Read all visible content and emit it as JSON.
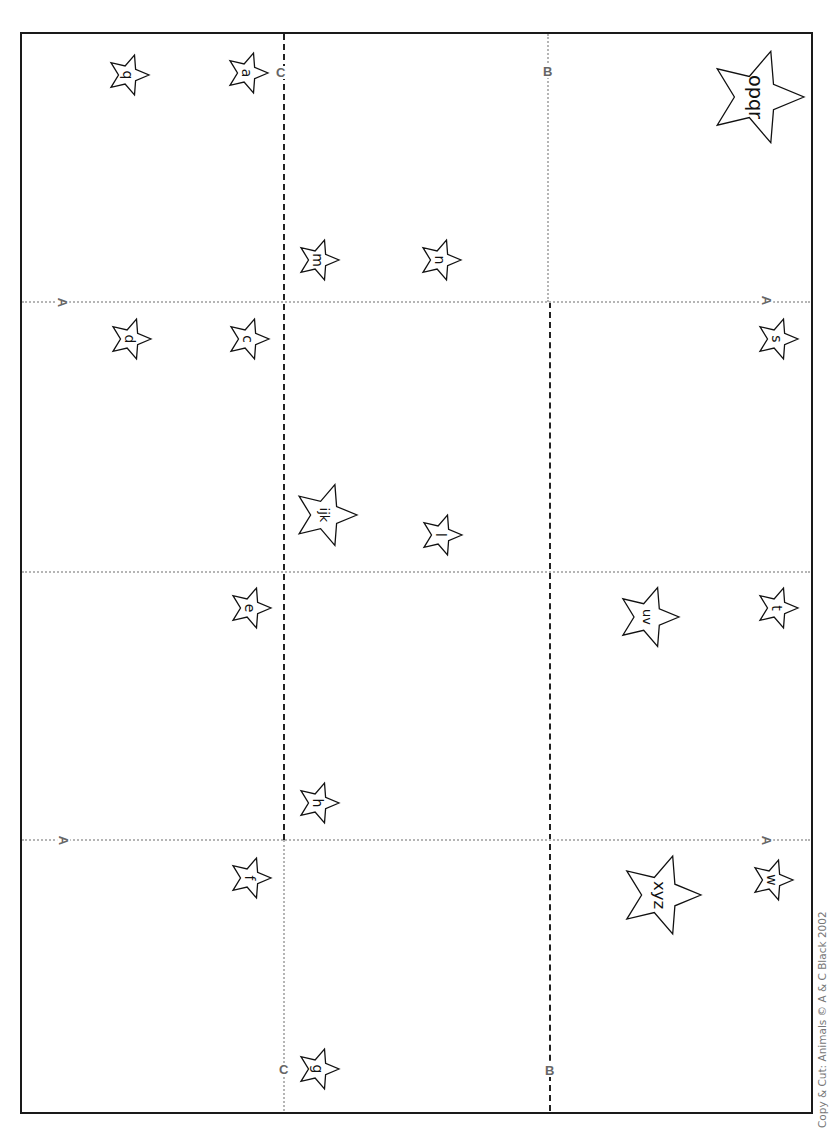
{
  "worksheet": {
    "copyright": "Copy & Cut: Animals © A & C Black 2002",
    "colors": {
      "border": "#1a1a1a",
      "cut_line": "#222222",
      "fold_line": "#b5b5b5",
      "guide_label": "#666666"
    },
    "guide_labels": [
      {
        "id": "c-top",
        "text": "C",
        "x": 276,
        "y": 66
      },
      {
        "id": "b-top",
        "text": "B",
        "x": 543,
        "y": 65
      },
      {
        "id": "a-left-1",
        "text": "A",
        "x": 58,
        "y": 296
      },
      {
        "id": "a-right-1",
        "text": "A",
        "x": 762,
        "y": 294
      },
      {
        "id": "a-left-2",
        "text": "A",
        "x": 59,
        "y": 834
      },
      {
        "id": "a-right-2",
        "text": "A",
        "x": 762,
        "y": 834
      },
      {
        "id": "c-bottom",
        "text": "C",
        "x": 279,
        "y": 1063
      },
      {
        "id": "b-bottom",
        "text": "B",
        "x": 545,
        "y": 1064
      }
    ],
    "stars": [
      {
        "id": "star-q",
        "text": "q",
        "cx": 128,
        "cy": 75,
        "size": 42
      },
      {
        "id": "star-a",
        "text": "a",
        "cx": 247,
        "cy": 73,
        "size": 42
      },
      {
        "id": "star-m",
        "text": "m",
        "cx": 318,
        "cy": 260,
        "size": 42
      },
      {
        "id": "star-n",
        "text": "n",
        "cx": 440,
        "cy": 260,
        "size": 42
      },
      {
        "id": "star-opqr",
        "text": "opqr",
        "cx": 756,
        "cy": 97,
        "size": 96
      },
      {
        "id": "star-d",
        "text": "d",
        "cx": 130,
        "cy": 339,
        "size": 42
      },
      {
        "id": "star-c",
        "text": "c",
        "cx": 248,
        "cy": 339,
        "size": 42
      },
      {
        "id": "star-s",
        "text": "s",
        "cx": 777,
        "cy": 339,
        "size": 42
      },
      {
        "id": "star-ijk",
        "text": "ijk",
        "cx": 325,
        "cy": 515,
        "size": 64
      },
      {
        "id": "star-l",
        "text": "l",
        "cx": 441,
        "cy": 535,
        "size": 42
      },
      {
        "id": "star-e",
        "text": "e",
        "cx": 250,
        "cy": 608,
        "size": 42
      },
      {
        "id": "star-uv",
        "text": "uv",
        "cx": 648,
        "cy": 617,
        "size": 62
      },
      {
        "id": "star-t",
        "text": "t",
        "cx": 777,
        "cy": 608,
        "size": 42
      },
      {
        "id": "star-h",
        "text": "h",
        "cx": 318,
        "cy": 803,
        "size": 42
      },
      {
        "id": "star-f",
        "text": "f",
        "cx": 250,
        "cy": 878,
        "size": 42
      },
      {
        "id": "star-xyz",
        "text": "xyz",
        "cx": 660,
        "cy": 895,
        "size": 82
      },
      {
        "id": "star-w",
        "text": "w",
        "cx": 772,
        "cy": 880,
        "size": 42
      },
      {
        "id": "star-g",
        "text": "g",
        "cx": 318,
        "cy": 1069,
        "size": 42
      }
    ]
  }
}
